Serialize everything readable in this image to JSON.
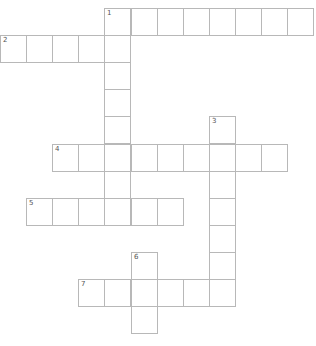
{
  "puzzle": {
    "type": "crossword",
    "cell_width": 26.1,
    "cell_height": 27.1,
    "origin_x": 0,
    "origin_y": 8,
    "border_color": "#b8b8b8",
    "words": [
      {
        "number": "1",
        "direction": "across",
        "row": 0,
        "col": 4,
        "length": 8
      },
      {
        "number": "1",
        "direction": "down",
        "row": 0,
        "col": 4,
        "length": 8
      },
      {
        "number": "2",
        "direction": "across",
        "row": 1,
        "col": 0,
        "length": 5
      },
      {
        "number": "3",
        "direction": "down",
        "row": 4,
        "col": 8,
        "length": 7
      },
      {
        "number": "4",
        "direction": "across",
        "row": 5,
        "col": 2,
        "length": 9
      },
      {
        "number": "5",
        "direction": "across",
        "row": 7,
        "col": 1,
        "length": 6
      },
      {
        "number": "6",
        "direction": "down",
        "row": 9,
        "col": 5,
        "length": 3
      },
      {
        "number": "7",
        "direction": "across",
        "row": 10,
        "col": 3,
        "length": 6
      }
    ]
  }
}
